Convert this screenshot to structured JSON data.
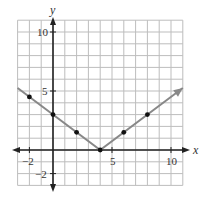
{
  "chart_data": {
    "type": "line",
    "title": "",
    "xlabel": "x",
    "ylabel": "y",
    "xlim": [
      -3,
      11
    ],
    "ylim": [
      -3,
      11
    ],
    "grid": true,
    "x_ticks_labeled": [
      "-2",
      "5",
      "10"
    ],
    "y_ticks_labeled": [
      "-2",
      "5",
      "10"
    ],
    "series": [
      {
        "name": "y = 0.75|x - 4|",
        "line_x": [
          -3,
          4,
          11
        ],
        "line_y": [
          5.25,
          0,
          5.25
        ],
        "points": [
          {
            "x": -2,
            "y": 4.5
          },
          {
            "x": 0,
            "y": 3
          },
          {
            "x": 2,
            "y": 1.5
          },
          {
            "x": 4,
            "y": 0
          },
          {
            "x": 6,
            "y": 1.5
          },
          {
            "x": 8,
            "y": 3
          }
        ],
        "color": "#888888"
      }
    ]
  },
  "labels": {
    "x_axis": "x",
    "y_axis": "y",
    "x_tick_neg2": "−2",
    "x_tick_5": "5",
    "x_tick_10": "10",
    "y_tick_neg2": "−2",
    "y_tick_5": "5",
    "y_tick_10": "10"
  }
}
